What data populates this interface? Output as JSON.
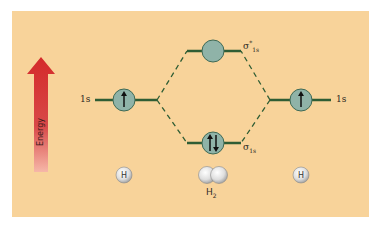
{
  "diagram": {
    "energy_axis": {
      "label": "Energy",
      "arrow_color_top": "#d62828",
      "arrow_color_bottom": "#f2a0a0"
    },
    "left_atom": {
      "orbital_label": "1s",
      "electrons": "up",
      "atom_label": "H"
    },
    "right_atom": {
      "orbital_label": "1s",
      "electrons": "up",
      "atom_label": "H"
    },
    "antibonding": {
      "symbol": "σ",
      "superscript": "*",
      "subscript": "1s",
      "electrons": "none"
    },
    "bonding": {
      "symbol": "σ",
      "subscript": "1s",
      "electrons": "up-down"
    },
    "molecule": {
      "label_base": "H",
      "label_sub": "2"
    },
    "colors": {
      "background": "#f8d39a",
      "orbital_line": "#2f5d34",
      "orbital_fill": "#8fb3a8",
      "dash": "#2f5d34"
    }
  }
}
